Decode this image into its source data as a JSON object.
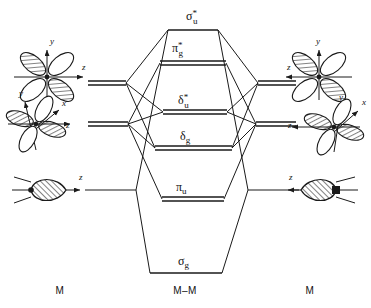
{
  "diagram": {
    "type": "molecular-orbital-correlation-diagram",
    "title": "",
    "colors": {
      "line": "#1a1a1a",
      "background": "#ffffff",
      "hatch": "#1a1a1a"
    },
    "columns": [
      {
        "id": "left-fragment",
        "label": "M",
        "x": 60
      },
      {
        "id": "center-molecule",
        "label": "M–M",
        "x": 185
      },
      {
        "id": "right-fragment",
        "label": "M",
        "x": 310
      }
    ],
    "column_label_y": 294,
    "molecular_orbitals": [
      {
        "id": "sigma-u-star",
        "symbol": "σ",
        "subscript": "u",
        "superscript": "*",
        "label_text": "σ*u",
        "level_y": 30,
        "x1": 168,
        "x2": 218,
        "label_x": 186,
        "label_y": 20,
        "double_line": false,
        "character": "antibonding"
      },
      {
        "id": "pi-g-star",
        "symbol": "π",
        "subscript": "g",
        "superscript": "*",
        "label_text": "π*g",
        "level_y": 63,
        "x1": 160,
        "x2": 226,
        "label_x": 172,
        "label_y": 52,
        "double_line": true,
        "character": "antibonding"
      },
      {
        "id": "delta-u-star",
        "symbol": "δ",
        "subscript": "u",
        "superscript": "*",
        "label_text": "δ*u",
        "level_y": 112,
        "x1": 163,
        "x2": 227,
        "label_x": 178,
        "label_y": 104,
        "double_line": true,
        "character": "antibonding"
      },
      {
        "id": "delta-g",
        "symbol": "δ",
        "subscript": "g",
        "superscript": "",
        "label_text": "δg",
        "level_y": 148,
        "x1": 155,
        "x2": 232,
        "label_x": 180,
        "label_y": 140,
        "double_line": true,
        "character": "bonding"
      },
      {
        "id": "pi-u",
        "symbol": "π",
        "subscript": "u",
        "superscript": "",
        "label_text": "πu",
        "level_y": 199,
        "x1": 162,
        "x2": 224,
        "label_x": 176,
        "label_y": 191,
        "double_line": true,
        "character": "bonding"
      },
      {
        "id": "sigma-g",
        "symbol": "σ",
        "subscript": "g",
        "superscript": "",
        "label_text": "σg",
        "level_y": 273,
        "x1": 150,
        "x2": 222,
        "label_x": 178,
        "label_y": 265,
        "double_line": false,
        "character": "bonding"
      }
    ],
    "fragment_levels": [
      {
        "id": "left-d-upper",
        "side": "left",
        "y": 83,
        "x1": 88,
        "x2": 126,
        "double_line": true
      },
      {
        "id": "left-d-lower",
        "side": "left",
        "y": 124,
        "x1": 88,
        "x2": 128,
        "double_line": true
      },
      {
        "id": "left-sigma",
        "side": "left",
        "y": 190,
        "x1": 85,
        "x2": 136,
        "double_line": false
      },
      {
        "id": "right-d-upper",
        "side": "right",
        "y": 83,
        "x1": 258,
        "x2": 296,
        "double_line": true
      },
      {
        "id": "right-d-lower",
        "side": "right",
        "y": 124,
        "x1": 256,
        "x2": 296,
        "double_line": true
      },
      {
        "id": "right-sigma",
        "side": "right",
        "y": 190,
        "x1": 248,
        "x2": 299,
        "double_line": false
      }
    ],
    "orbital_sketches": [
      {
        "id": "left-four-lobe-d",
        "side": "left",
        "type": "d-orbital-four-lobe",
        "cx": 47,
        "cy": 77,
        "axes": [
          {
            "name": "y",
            "label": "y",
            "label_x": 50,
            "label_y": 44
          },
          {
            "name": "z",
            "label": "z",
            "label_x": 82,
            "label_y": 70
          }
        ]
      },
      {
        "id": "left-four-lobe-d-xyz",
        "side": "left",
        "type": "d-orbital-four-lobe",
        "cx": 36,
        "cy": 124,
        "axes": [
          {
            "name": "y",
            "label": "y",
            "label_x": 19,
            "label_y": 96
          },
          {
            "name": "x",
            "label": "x",
            "label_x": 62,
            "label_y": 106
          },
          {
            "name": "z",
            "label": "z",
            "label_x": 66,
            "label_y": 128
          }
        ]
      },
      {
        "id": "left-sigma-hybrid",
        "side": "left",
        "type": "sigma-hybrid-lobe",
        "cx": 46,
        "cy": 190,
        "axes": [
          {
            "name": "z",
            "label": "z",
            "label_x": 79,
            "label_y": 180
          }
        ]
      },
      {
        "id": "right-four-lobe-d",
        "side": "right",
        "type": "d-orbital-four-lobe",
        "cx": 319,
        "cy": 77,
        "axes": [
          {
            "name": "y",
            "label": "y",
            "label_x": 316,
            "label_y": 44
          },
          {
            "name": "z",
            "label": "z",
            "label_x": 287,
            "label_y": 70
          }
        ]
      },
      {
        "id": "right-four-lobe-d-xyz",
        "side": "right",
        "type": "d-orbital-four-lobe",
        "cx": 334,
        "cy": 127,
        "axes": [
          {
            "name": "y",
            "label": "y",
            "label_x": 339,
            "label_y": 100
          },
          {
            "name": "x",
            "label": "x",
            "label_x": 362,
            "label_y": 105
          },
          {
            "name": "z",
            "label": "z",
            "label_x": 288,
            "label_y": 128
          }
        ]
      },
      {
        "id": "right-sigma-hybrid",
        "side": "right",
        "type": "sigma-hybrid-lobe",
        "cx": 320,
        "cy": 190,
        "axes": [
          {
            "name": "z",
            "label": "z",
            "label_x": 289,
            "label_y": 180
          }
        ]
      }
    ]
  }
}
